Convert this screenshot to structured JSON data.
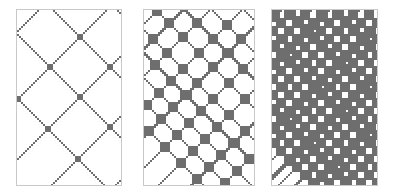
{
  "figure": {
    "title": "",
    "background_color": "#ffffff",
    "width": 396,
    "height": 196,
    "panel_count": 3
  },
  "panels": [
    {
      "id": "panel-sparse",
      "label": "",
      "density_level": "sparse",
      "x": 16,
      "y": 9,
      "width": 106,
      "height": 177,
      "border_color": "#c9c9c9",
      "ink_color": "#6e6e6e",
      "background_color": "#ffffff",
      "cell_size": 2,
      "line_thickness": 1,
      "fill_fraction": 0.06,
      "pattern": {
        "type": "diagonal-lattice",
        "down_right_offsets": [
          -44,
          -12,
          18,
          50,
          82
        ],
        "down_left_offsets": [
          10,
          44,
          74,
          104,
          136,
          166
        ],
        "band_widths_dr": [
          1,
          1,
          1,
          1,
          1
        ],
        "band_widths_dl": [
          1,
          1,
          1,
          1,
          1,
          1
        ],
        "intersection_blob_size": 3
      }
    },
    {
      "id": "panel-medium",
      "label": "",
      "density_level": "medium",
      "x": 143,
      "y": 9,
      "width": 112,
      "height": 177,
      "border_color": "#c9c9c9",
      "ink_color": "#6e6e6e",
      "background_color": "#ffffff",
      "cell_size": 2,
      "line_thickness": 1,
      "fill_fraction": 0.18,
      "pattern": {
        "type": "diagonal-lattice",
        "down_right_offsets": [
          -58,
          -46,
          -34,
          -22,
          -10,
          6,
          20,
          34,
          50,
          66,
          82,
          96
        ],
        "down_left_offsets": [
          6,
          18,
          32,
          48,
          62,
          78,
          94,
          110,
          126,
          142,
          158,
          174
        ],
        "band_widths_dr": [
          1,
          1,
          1,
          2,
          1,
          1,
          2,
          1,
          1,
          1,
          2,
          1
        ],
        "band_widths_dl": [
          1,
          2,
          1,
          1,
          2,
          1,
          1,
          2,
          1,
          1,
          2,
          1
        ],
        "intersection_blob_size": 4
      }
    },
    {
      "id": "panel-dense",
      "label": "",
      "density_level": "dense",
      "x": 271,
      "y": 9,
      "width": 107,
      "height": 177,
      "border_color": "#c9c9c9",
      "ink_color": "#6e6e6e",
      "background_color": "#ffffff",
      "cell_size": 2,
      "line_thickness": 2,
      "fill_fraction": 0.42,
      "pattern": {
        "type": "diagonal-lattice",
        "down_right_offsets": [
          -66,
          -58,
          -50,
          -42,
          -34,
          -26,
          -18,
          -10,
          -2,
          6,
          14,
          22,
          30,
          38,
          46,
          54,
          62,
          70,
          78,
          86,
          94,
          102
        ],
        "down_left_offsets": [
          2,
          10,
          18,
          26,
          34,
          42,
          50,
          58,
          66,
          74,
          82,
          90,
          98,
          106,
          114,
          122,
          130,
          138,
          146,
          154,
          162,
          170,
          178
        ],
        "band_widths_dr": [
          2,
          1,
          3,
          1,
          2,
          1,
          3,
          2,
          1,
          3,
          1,
          2,
          3,
          1,
          2,
          1,
          3,
          1,
          2,
          3,
          1,
          2
        ],
        "band_widths_dl": [
          3,
          1,
          2,
          3,
          1,
          2,
          1,
          3,
          2,
          1,
          3,
          1,
          2,
          3,
          1,
          2,
          1,
          3,
          2,
          1,
          3,
          1,
          2
        ],
        "intersection_blob_size": 5
      }
    }
  ],
  "chart_data": {
    "type": "heatmap",
    "title": "",
    "subtitle": "",
    "xlabel": "",
    "ylabel": "",
    "legend": [],
    "annotations": [],
    "grid": false,
    "series": [
      {
        "name": "sparse",
        "description": "Binary diagonal plaid lattice, low density",
        "fill_fraction": 0.06,
        "grid_cols": 53,
        "grid_rows": 88
      },
      {
        "name": "medium",
        "description": "Binary diagonal plaid lattice, medium density",
        "fill_fraction": 0.18,
        "grid_cols": 56,
        "grid_rows": 88
      },
      {
        "name": "dense",
        "description": "Binary diagonal plaid lattice, high density",
        "fill_fraction": 0.42,
        "grid_cols": 53,
        "grid_rows": 88
      }
    ],
    "categories": [
      "sparse",
      "medium",
      "dense"
    ],
    "values": [
      0.06,
      0.18,
      0.42
    ],
    "colors": {
      "ink": "#6e6e6e",
      "background": "#ffffff",
      "border": "#c9c9c9"
    }
  }
}
